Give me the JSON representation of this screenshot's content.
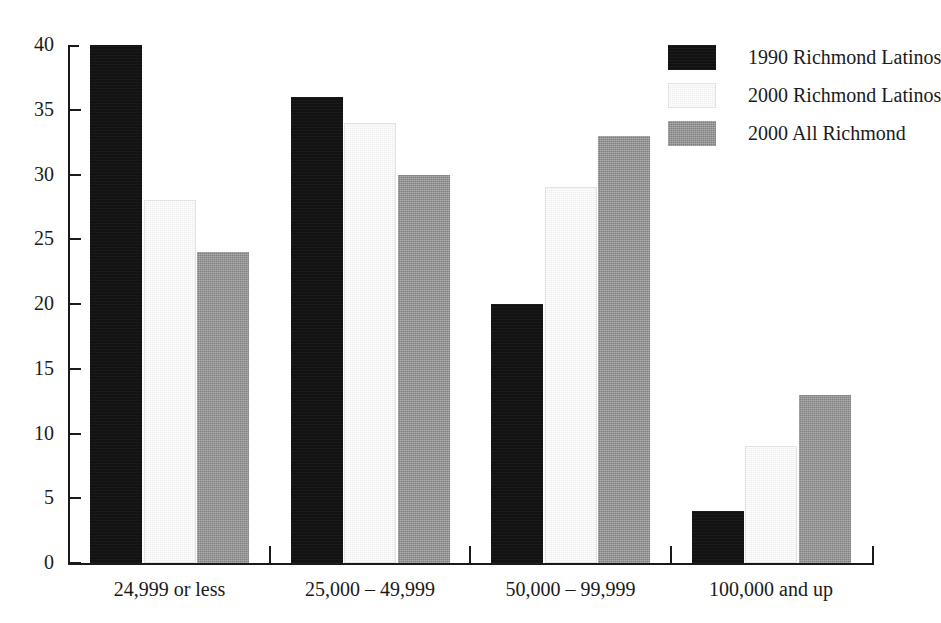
{
  "chart_data": {
    "type": "bar",
    "title": "",
    "subtitle": "",
    "xlabel": "",
    "ylabel": "",
    "ylim": [
      0,
      40
    ],
    "yticks": [
      0,
      5,
      10,
      15,
      20,
      25,
      30,
      35,
      40
    ],
    "ytick_labels": [
      "0",
      "5",
      "10",
      "15",
      "20",
      "25",
      "30",
      "35",
      "40"
    ],
    "grid": false,
    "legend_position": "top-right",
    "categories": [
      "24,999 or less",
      "25,000 – 49,999",
      "50,000 – 99,999",
      "100,000 and up"
    ],
    "series": [
      {
        "name": "1990 Richmond Latinos",
        "color": "#121212",
        "values": [
          40,
          36,
          20,
          4
        ]
      },
      {
        "name": "2000 Richmond Latinos",
        "color": "#ededed",
        "values": [
          28,
          34,
          29,
          9
        ]
      },
      {
        "name": "2000 All Richmond",
        "color": "#8d8d8d",
        "values": [
          24,
          30,
          33,
          13
        ]
      }
    ],
    "annotations": []
  },
  "legend": {
    "entries": [
      {
        "label": "1990 Richmond Latinos"
      },
      {
        "label": "2000 Richmond Latinos"
      },
      {
        "label": "2000 All Richmond"
      }
    ]
  },
  "axes": {
    "y_tick_labels": [
      "40",
      "35",
      "30",
      "25",
      "20",
      "15",
      "10",
      "5",
      "0"
    ],
    "x_group_labels": [
      "24,999 or less",
      "25,000 – 49,999",
      "50,000 – 99,999",
      "100,000 and up"
    ]
  },
  "colors": {
    "axis": "#1a1a1a",
    "text": "#1a1a1a",
    "background": "#ffffff",
    "series_1990_latinos": "#121212",
    "series_2000_latinos": "#ededed",
    "series_2000_all": "#8d8d8d"
  }
}
